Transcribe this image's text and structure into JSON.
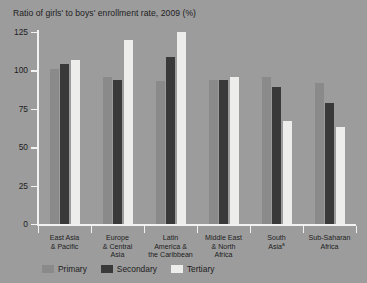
{
  "chart_data": {
    "type": "bar",
    "title": "Ratio of girls' to boys' enrollment rate, 2009 (%)",
    "xlabel": "",
    "ylabel": "",
    "ylim": [
      0,
      125
    ],
    "yticks": [
      0,
      25,
      50,
      75,
      100,
      125
    ],
    "ytick_labels": [
      "0",
      "25",
      "50",
      "75",
      "100",
      "125"
    ],
    "grid": false,
    "legend_position": "bottom-left",
    "categories": [
      "East Asia\n& Pacific",
      "Europe\n& Central\nAsia",
      "Latin\nAmerica &\nthe Caribbean",
      "Middle East\n& North\nAfrica",
      "South\nAsia",
      "Sub-Saharan\nAfrica"
    ],
    "category_lines": [
      [
        "East Asia",
        "& Pacific"
      ],
      [
        "Europe",
        "& Central",
        "Asia"
      ],
      [
        "Latin",
        "America &",
        "the Caribbean"
      ],
      [
        "Middle East",
        "& North",
        "Africa"
      ],
      [
        "South",
        "Asia"
      ],
      [
        "Sub-Saharan",
        "Africa"
      ]
    ],
    "category_footnote_index": 4,
    "category_footnote_marker": "a",
    "series": [
      {
        "name": "Primary",
        "color": "#8a8a8a",
        "values": [
          101,
          96,
          93,
          94,
          96,
          92
        ]
      },
      {
        "name": "Secondary",
        "color": "#39393a",
        "values": [
          104,
          94,
          109,
          94,
          89,
          79
        ]
      },
      {
        "name": "Tertiary",
        "color": "#ededeb",
        "values": [
          107,
          120,
          125,
          96,
          67,
          63
        ]
      }
    ]
  },
  "legend": {
    "items": [
      {
        "label": "Primary",
        "swatch": "primary"
      },
      {
        "label": "Secondary",
        "swatch": "secondary"
      },
      {
        "label": "Tertiary",
        "swatch": "tertiary"
      }
    ]
  }
}
